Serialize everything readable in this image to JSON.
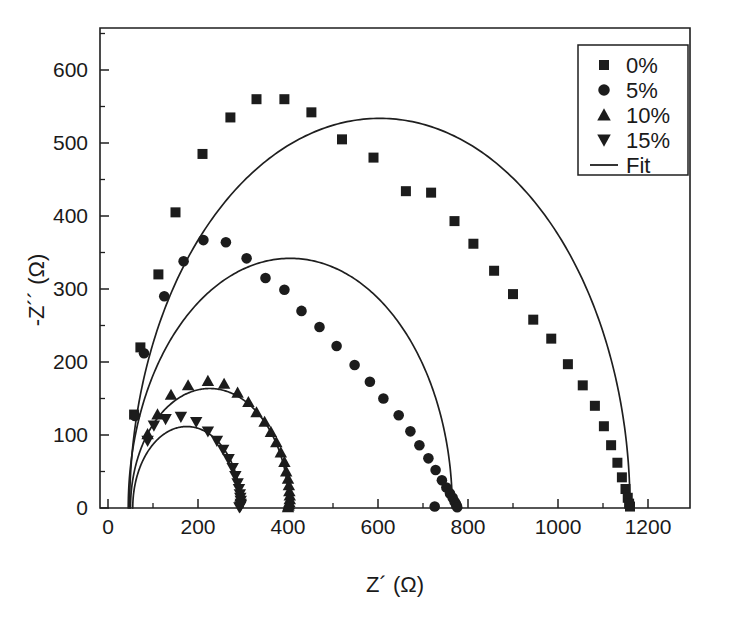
{
  "chart_data": {
    "type": "scatter",
    "title": "",
    "xlabel": "Z´ (Ω)",
    "ylabel": "-Z´´ (Ω)",
    "xlim": [
      0,
      1288
    ],
    "ylim": [
      0,
      657
    ],
    "grid": false,
    "legend_position": "top-right",
    "xticks": [
      0,
      200,
      400,
      600,
      800,
      1000,
      1200
    ],
    "xticklabels": [
      "0",
      "200",
      "400",
      "600",
      "800",
      "1000",
      "1200"
    ],
    "xminor_step": 100,
    "yticks": [
      0,
      100,
      200,
      300,
      400,
      500,
      600
    ],
    "yticklabels": [
      "0",
      "100",
      "200",
      "300",
      "400",
      "500",
      "600"
    ],
    "yminor_step": 50,
    "series": [
      {
        "name": "0%",
        "marker": "square",
        "fit": {
          "r_series": 48,
          "r_ct": 1112,
          "depression": 0.96
        },
        "points": [
          [
            58,
            128
          ],
          [
            72,
            220
          ],
          [
            112,
            320
          ],
          [
            150,
            405
          ],
          [
            210,
            485
          ],
          [
            272,
            535
          ],
          [
            330,
            560
          ],
          [
            392,
            560
          ],
          [
            452,
            542
          ],
          [
            520,
            505
          ],
          [
            590,
            480
          ],
          [
            662,
            434
          ],
          [
            718,
            432
          ],
          [
            770,
            393
          ],
          [
            812,
            362
          ],
          [
            858,
            325
          ],
          [
            900,
            293
          ],
          [
            945,
            258
          ],
          [
            985,
            232
          ],
          [
            1022,
            197
          ],
          [
            1055,
            168
          ],
          [
            1082,
            140
          ],
          [
            1102,
            112
          ],
          [
            1118,
            86
          ],
          [
            1132,
            62
          ],
          [
            1142,
            42
          ],
          [
            1150,
            26
          ],
          [
            1155,
            14
          ],
          [
            1158,
            6
          ],
          [
            1160,
            2
          ]
        ]
      },
      {
        "name": "5%",
        "marker": "circle",
        "fit": {
          "r_series": 45,
          "r_ct": 720,
          "depression": 0.95
        },
        "points": [
          [
            60,
            126
          ],
          [
            80,
            212
          ],
          [
            125,
            290
          ],
          [
            168,
            338
          ],
          [
            212,
            367
          ],
          [
            262,
            364
          ],
          [
            308,
            342
          ],
          [
            350,
            315
          ],
          [
            392,
            299
          ],
          [
            430,
            270
          ],
          [
            470,
            248
          ],
          [
            508,
            222
          ],
          [
            548,
            196
          ],
          [
            582,
            173
          ],
          [
            612,
            150
          ],
          [
            646,
            127
          ],
          [
            672,
            105
          ],
          [
            692,
            86
          ],
          [
            712,
            68
          ],
          [
            728,
            52
          ],
          [
            742,
            38
          ],
          [
            752,
            28
          ],
          [
            760,
            20
          ],
          [
            766,
            14
          ],
          [
            770,
            9
          ],
          [
            773,
            6
          ],
          [
            775,
            3
          ],
          [
            776,
            1
          ],
          [
            726,
            2
          ]
        ]
      },
      {
        "name": "10%",
        "marker": "triangle-up",
        "fit": {
          "r_series": 50,
          "r_ct": 352,
          "depression": 0.93
        },
        "points": [
          [
            88,
            101
          ],
          [
            110,
            128
          ],
          [
            140,
            155
          ],
          [
            178,
            168
          ],
          [
            222,
            174
          ],
          [
            258,
            170
          ],
          [
            288,
            158
          ],
          [
            312,
            145
          ],
          [
            330,
            131
          ],
          [
            348,
            118
          ],
          [
            362,
            104
          ],
          [
            374,
            90
          ],
          [
            384,
            76
          ],
          [
            392,
            63
          ],
          [
            396,
            50
          ],
          [
            400,
            40
          ],
          [
            402,
            31
          ],
          [
            403,
            23
          ],
          [
            404,
            17
          ],
          [
            404,
            12
          ],
          [
            403,
            8
          ],
          [
            402,
            5
          ],
          [
            401,
            3
          ],
          [
            400,
            1
          ]
        ]
      },
      {
        "name": "15%",
        "marker": "triangle-down",
        "fit": {
          "r_series": 55,
          "r_ct": 240,
          "depression": 0.93
        },
        "points": [
          [
            88,
            92
          ],
          [
            102,
            113
          ],
          [
            128,
            122
          ],
          [
            162,
            125
          ],
          [
            196,
            118
          ],
          [
            222,
            105
          ],
          [
            242,
            92
          ],
          [
            256,
            80
          ],
          [
            268,
            67
          ],
          [
            277,
            55
          ],
          [
            283,
            44
          ],
          [
            288,
            34
          ],
          [
            291,
            26
          ],
          [
            293,
            19
          ],
          [
            294,
            14
          ],
          [
            295,
            10
          ],
          [
            295,
            6
          ],
          [
            295,
            4
          ],
          [
            294,
            2
          ],
          [
            292,
            1
          ]
        ]
      }
    ],
    "legend": [
      {
        "label": "0%",
        "marker": "square"
      },
      {
        "label": "5%",
        "marker": "circle"
      },
      {
        "label": "10%",
        "marker": "triangle-up"
      },
      {
        "label": "15%",
        "marker": "triangle-down"
      },
      {
        "label": "Fit",
        "marker": "line"
      }
    ],
    "colors": {
      "ink": "#1c1c1c",
      "background": "#ffffff"
    }
  }
}
